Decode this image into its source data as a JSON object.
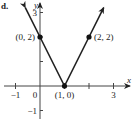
{
  "figure_label": "d.",
  "chart_data": {
    "type": "line",
    "title": "",
    "xlabel": "x",
    "ylabel": "y",
    "xlim": [
      -1.5,
      3.5
    ],
    "ylim": [
      -1.5,
      3.4
    ],
    "grid": false,
    "x_ticks": [
      -1,
      1,
      2,
      3
    ],
    "x_tick_labels": [
      {
        "value": -1,
        "label": "−1"
      },
      {
        "value": 0,
        "label": "0"
      },
      {
        "value": 3,
        "label": "3"
      }
    ],
    "y_ticks": [
      -1,
      1,
      2,
      3
    ],
    "y_tick_labels": [
      {
        "value": 3,
        "label": "3"
      },
      {
        "value": -1,
        "label": "−1"
      }
    ],
    "series": [
      {
        "name": "y = 2|x − 1|",
        "x": [
          -0.6,
          0,
          1,
          2,
          2.6
        ],
        "y": [
          3.2,
          2,
          0,
          2,
          3.2
        ],
        "arrows": "both-ends"
      }
    ],
    "points": [
      {
        "x": 0,
        "y": 2,
        "label": "(0, 2)",
        "label_pos": "left"
      },
      {
        "x": 1,
        "y": 0,
        "label": "(1, 0)",
        "label_pos": "below"
      },
      {
        "x": 2,
        "y": 2,
        "label": "(2, 2)",
        "label_pos": "right"
      }
    ]
  }
}
